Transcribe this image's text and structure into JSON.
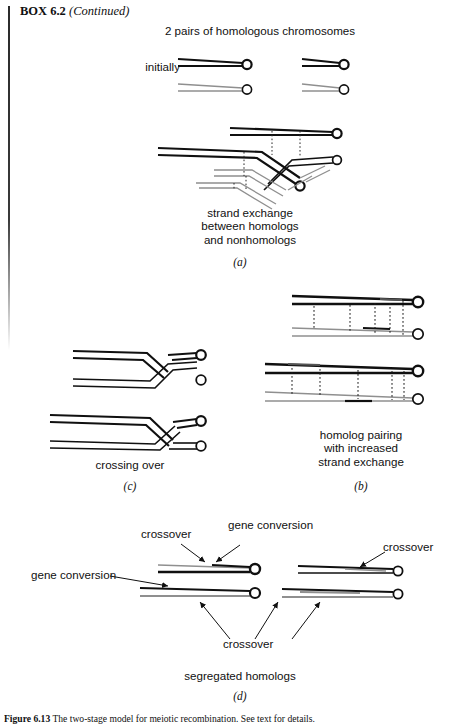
{
  "box": {
    "label": "BOX 6.2",
    "continued": "(Continued)"
  },
  "headings": {
    "top": "2 pairs of homologous chromosomes"
  },
  "labels": {
    "initially": "initially",
    "strand_exchange": "strand exchange\nbetween homologs\nand nonhomologs",
    "homolog_pairing": "homolog pairing\nwith increased\nstrand exchange",
    "crossing_over": "crossing over",
    "segregated_homologs": "segregated homologs"
  },
  "panel_letters": {
    "a": "(a)",
    "b": "(b)",
    "c": "(c)",
    "d": "(d)"
  },
  "annotations": {
    "crossover_left": "crossover",
    "gene_conversion_top": "gene conversion",
    "crossover_right": "crossover",
    "gene_conversion_left": "gene conversion",
    "crossover_bottom": "crossover"
  },
  "figure_caption": {
    "number": "Figure 6.13",
    "text": "The two-stage model for meiotic recombination. See text for details."
  },
  "colors": {
    "ink_dark": "#101010",
    "ink_gray": "#8f8f8f",
    "paper": "#ffffff"
  }
}
